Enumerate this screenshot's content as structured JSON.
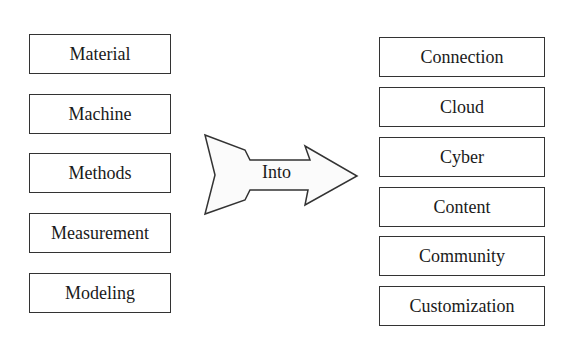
{
  "diagram": {
    "left_items": [
      "Material",
      "Machine",
      "Methods",
      "Measurement",
      "Modeling"
    ],
    "arrow_label": "Into",
    "right_items": [
      "Connection",
      "Cloud",
      "Cyber",
      "Content",
      "Community",
      "Customization"
    ]
  }
}
